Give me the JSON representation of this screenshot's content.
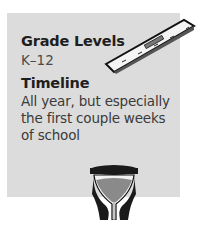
{
  "card": {
    "grade_levels_heading": "Grade Levels",
    "grade_levels_value": "K–12",
    "timeline_heading": "Timeline",
    "timeline_value": "All year, but especially the first couple weeks of school"
  },
  "icons": {
    "ruler": "ruler-icon",
    "hourglass": "hourglass-icon"
  },
  "colors": {
    "card_background": "#dcdcdc",
    "heading": "#1e1e1e",
    "text": "#3a3a3a"
  }
}
